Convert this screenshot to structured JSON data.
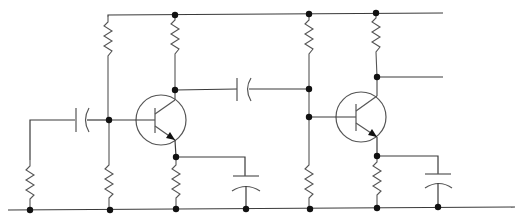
{
  "diagram": {
    "type": "circuit-schematic",
    "colors": {
      "wire": "#3a3a3a",
      "component": "#555555",
      "node": "#111111",
      "background": "#ffffff"
    },
    "components": {
      "transistors": [
        {
          "id": "Q1",
          "type": "NPN",
          "cx": 161,
          "cy": 120
        },
        {
          "id": "Q2",
          "type": "NPN",
          "cx": 361,
          "cy": 117
        }
      ],
      "resistors": [
        {
          "id": "R-input",
          "x": 30,
          "y1": 160,
          "y2": 205
        },
        {
          "id": "R1-bias-top",
          "x": 108,
          "y1": 17,
          "y2": 60
        },
        {
          "id": "R1-bias-bottom",
          "x": 109,
          "y1": 163,
          "y2": 205
        },
        {
          "id": "R1-collector",
          "x": 175,
          "y1": 20,
          "y2": 60
        },
        {
          "id": "R1-emitter",
          "x": 176,
          "y1": 163,
          "y2": 205
        },
        {
          "id": "R2-bias-top",
          "x": 309,
          "y1": 20,
          "y2": 60
        },
        {
          "id": "R2-bias-bottom",
          "x": 309,
          "y1": 163,
          "y2": 205
        },
        {
          "id": "R2-collector",
          "x": 376,
          "y1": 18,
          "y2": 60
        },
        {
          "id": "R2-emitter",
          "x": 377,
          "y1": 162,
          "y2": 202
        }
      ],
      "capacitors": [
        {
          "id": "C-input",
          "orientation": "horizontal"
        },
        {
          "id": "C-coupling",
          "orientation": "horizontal"
        },
        {
          "id": "C1-emitter-bypass",
          "orientation": "vertical"
        },
        {
          "id": "C2-emitter-bypass",
          "orientation": "vertical"
        }
      ]
    },
    "rails": [
      "supply-top-rail",
      "ground-bottom-rail"
    ],
    "output_terminals": [
      "top-rail-output",
      "collector-output"
    ]
  }
}
